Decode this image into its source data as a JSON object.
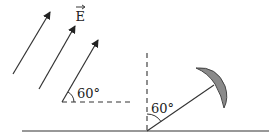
{
  "diagram": {
    "field_label": "E",
    "field_label_has_vector_arrow": true,
    "field_angle_label": "60°",
    "mirror_angle_label": "60°",
    "colors": {
      "line": "#333333",
      "mirror_fill": "#8a8a8a",
      "mirror_stroke": "#444444",
      "background": "#ffffff"
    },
    "elements": [
      {
        "type": "arrow",
        "name": "field-arrow-1"
      },
      {
        "type": "arrow",
        "name": "field-arrow-2"
      },
      {
        "type": "arrow",
        "name": "field-arrow-3"
      },
      {
        "type": "dashed-line",
        "name": "horizontal-reference",
        "orientation": "horizontal"
      },
      {
        "type": "dashed-line",
        "name": "vertical-reference",
        "orientation": "vertical"
      },
      {
        "type": "line",
        "name": "ground"
      },
      {
        "type": "line",
        "name": "mirror-support"
      },
      {
        "type": "crescent",
        "name": "curved-mirror"
      }
    ]
  }
}
